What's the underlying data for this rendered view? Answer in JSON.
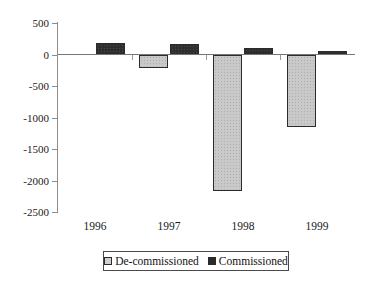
{
  "chart_data": {
    "type": "bar",
    "title": "",
    "subtitle": "",
    "xlabel": "",
    "ylabel": "",
    "categories": [
      "1996",
      "1997",
      "1998",
      "1999"
    ],
    "series": [
      {
        "name": "De-commissioned",
        "values": [
          0,
          -210,
          -2160,
          -1145
        ],
        "color": "#cfcfcf"
      },
      {
        "name": "Commissioned",
        "values": [
          175,
          160,
          110,
          60
        ],
        "color": "#2b2b2b"
      }
    ],
    "ylim": [
      -2500,
      500
    ],
    "ytick_values": [
      500,
      0,
      -500,
      -1000,
      -1500,
      -2000,
      -2500
    ],
    "ytick_labels": [
      "500",
      "0",
      "-500",
      "-1000",
      "-1500",
      "-2000",
      "-2500"
    ],
    "grid": false,
    "legend_position": "bottom",
    "orientation": "vertical",
    "grouping": "grouped",
    "zero_line": true
  },
  "axis": {
    "y_labels": [
      "500",
      "0",
      "-500",
      "-1000",
      "-1500",
      "-2000",
      "-2500"
    ],
    "x_labels": [
      "1996",
      "1997",
      "1998",
      "1999"
    ]
  },
  "legend": {
    "items": [
      {
        "label": "De-commissioned",
        "swatch": "decommissioned"
      },
      {
        "label": "Commissioned",
        "swatch": "commissioned"
      }
    ]
  }
}
